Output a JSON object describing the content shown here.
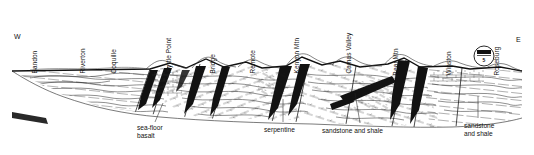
{
  "figure": {
    "kind": "geologic-cross-section",
    "background_color": "#ffffff",
    "ink_color": "#111111",
    "width": 534,
    "height": 155
  },
  "compass": {
    "west_label": "W",
    "east_label": "E",
    "west_x": 14,
    "west_y": 33,
    "east_x": 516,
    "east_y": 36
  },
  "place_labels": [
    {
      "name": "Bandon",
      "x": 38,
      "y": 67
    },
    {
      "name": "Riverton",
      "x": 86,
      "y": 67
    },
    {
      "name": "Coquille",
      "x": 117,
      "y": 67
    },
    {
      "name": "Myrtle Point",
      "x": 172,
      "y": 67
    },
    {
      "name": "Bridge",
      "x": 216,
      "y": 67
    },
    {
      "name": "Remote",
      "x": 256,
      "y": 67
    },
    {
      "name": "Kenyon Mtn",
      "x": 300,
      "y": 67
    },
    {
      "name": "Camas Valley",
      "x": 352,
      "y": 67
    },
    {
      "name": "Bear Mtn",
      "x": 399,
      "y": 69
    },
    {
      "name": "Winston",
      "x": 452,
      "y": 69
    },
    {
      "name": "Roseburg",
      "x": 500,
      "y": 69
    }
  ],
  "unit_labels": [
    {
      "id": "sea-floor-basalt",
      "lines": [
        "sea-floor",
        "basalt"
      ],
      "x": 137,
      "y": 124,
      "leader": {
        "x1": 155,
        "y1": 122,
        "x2": 163,
        "y2": 103
      }
    },
    {
      "id": "serpentine",
      "lines": [
        "serpentine"
      ],
      "x": 264,
      "y": 126,
      "leader": {
        "x1": 283,
        "y1": 122,
        "x2": 283,
        "y2": 99
      }
    },
    {
      "id": "sandstone-and-shale-center",
      "lines": [
        "sandstone and shale"
      ],
      "x": 322,
      "y": 127,
      "leader": {
        "x1": 360,
        "y1": 123,
        "x2": 355,
        "y2": 93
      }
    },
    {
      "id": "sandstone-and-shale-right",
      "lines": [
        "sandstone",
        "and shale"
      ],
      "x": 464,
      "y": 122,
      "leader": {
        "x1": 478,
        "y1": 118,
        "x2": 478,
        "y2": 96
      }
    }
  ],
  "highway_shield": {
    "route_number": "5",
    "type": "interstate",
    "x": 484,
    "y": 56,
    "radius": 10
  },
  "section_geometry": {
    "ground_line_y": 71,
    "left_x": 12,
    "right_x": 522,
    "section_base_y": 118,
    "skyline_peaks": [
      {
        "x": 12,
        "y": 71
      },
      {
        "x": 150,
        "y": 69
      },
      {
        "x": 170,
        "y": 63
      },
      {
        "x": 186,
        "y": 68
      },
      {
        "x": 206,
        "y": 59
      },
      {
        "x": 224,
        "y": 67
      },
      {
        "x": 246,
        "y": 62
      },
      {
        "x": 262,
        "y": 68
      },
      {
        "x": 286,
        "y": 66
      },
      {
        "x": 302,
        "y": 57
      },
      {
        "x": 322,
        "y": 65
      },
      {
        "x": 340,
        "y": 61
      },
      {
        "x": 360,
        "y": 67
      },
      {
        "x": 388,
        "y": 64
      },
      {
        "x": 404,
        "y": 58
      },
      {
        "x": 420,
        "y": 67
      },
      {
        "x": 452,
        "y": 66
      },
      {
        "x": 470,
        "y": 69
      },
      {
        "x": 500,
        "y": 67
      },
      {
        "x": 522,
        "y": 71
      }
    ],
    "dark_bodies": [
      {
        "id": "basalt-wedge-1",
        "x": 162,
        "y": 74
      },
      {
        "id": "basalt-wedge-2",
        "x": 196,
        "y": 74
      },
      {
        "id": "serpentine-wedge",
        "x": 284,
        "y": 74
      },
      {
        "id": "fault-wedge-right",
        "x": 402,
        "y": 74
      },
      {
        "id": "thrust-toe-left",
        "x": 348,
        "y": 108
      }
    ]
  }
}
